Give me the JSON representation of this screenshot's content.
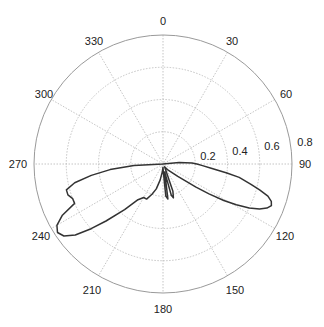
{
  "chart_data": {
    "type": "polar-line",
    "title": "",
    "angle_direction": "clockwise",
    "zero_location": "top",
    "angle_ticks": [
      0,
      30,
      60,
      90,
      120,
      150,
      180,
      210,
      240,
      270,
      300,
      330
    ],
    "radial_ticks": [
      0.2,
      0.4,
      0.6,
      0.8
    ],
    "rlim": [
      0,
      0.8
    ],
    "grid": true,
    "series": [
      {
        "name": "pattern",
        "color": "#333333",
        "theta_deg": [
          270,
          272,
          275,
          280,
          285,
          290,
          60,
          75,
          85,
          88,
          90,
          92,
          95,
          98,
          100,
          103,
          105,
          107,
          109,
          111,
          113,
          115,
          117,
          119,
          121,
          123,
          125,
          130,
          140,
          150,
          160,
          163,
          165,
          168,
          172,
          175,
          178,
          180,
          185,
          190,
          195,
          200,
          205,
          210,
          215,
          220,
          225,
          228,
          231,
          234,
          237,
          240,
          243,
          246,
          249,
          252,
          255,
          258,
          261,
          264,
          267,
          270
        ],
        "r": [
          0.0,
          0.0,
          0.0,
          0.0,
          0.0,
          0.0,
          0.0,
          0.0,
          0.1,
          0.18,
          0.21,
          0.24,
          0.3,
          0.4,
          0.48,
          0.56,
          0.62,
          0.68,
          0.71,
          0.72,
          0.7,
          0.66,
          0.6,
          0.52,
          0.44,
          0.34,
          0.25,
          0.12,
          0.05,
          0.02,
          0.18,
          0.22,
          0.2,
          0.05,
          0.22,
          0.2,
          0.04,
          0.02,
          0.05,
          0.1,
          0.16,
          0.2,
          0.24,
          0.24,
          0.27,
          0.37,
          0.5,
          0.6,
          0.7,
          0.76,
          0.78,
          0.76,
          0.7,
          0.6,
          0.6,
          0.62,
          0.62,
          0.56,
          0.45,
          0.33,
          0.18,
          0.0
        ]
      }
    ]
  },
  "labels": {
    "a0": "0",
    "a30": "30",
    "a60": "60",
    "a90": "90",
    "a120": "120",
    "a150": "150",
    "a180": "180",
    "a210": "210",
    "a240": "240",
    "a270": "270",
    "a300": "300",
    "a330": "330",
    "r02": "0.2",
    "r04": "0.4",
    "r06": "0.6",
    "r08": "0.8"
  }
}
